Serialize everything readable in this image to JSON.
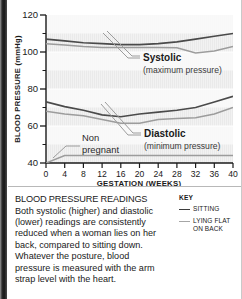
{
  "chart_data": {
    "type": "line",
    "title": "",
    "xlabel": "GESTATION (WEEKS)",
    "ylabel": "BLOOD PRESSURE (mmHg)",
    "xlim": [
      0,
      40
    ],
    "ylim": [
      40,
      120
    ],
    "xticks": [
      0,
      4,
      8,
      12,
      16,
      20,
      24,
      28,
      32,
      36,
      40
    ],
    "yticks": [
      40,
      60,
      80,
      100,
      120
    ],
    "yminorticks": [
      50,
      70,
      90,
      110
    ],
    "grid": "horizontal-bands",
    "legend_position": "below-right",
    "x": [
      0,
      4,
      8,
      12,
      16,
      20,
      24,
      28,
      32,
      36,
      40
    ],
    "series": [
      {
        "name": "Systolic - sitting",
        "group": "Systolic",
        "posture": "SITTING",
        "color": "#4a4a4a",
        "values": [
          107,
          106,
          105,
          104.5,
          104,
          104,
          104.5,
          105.5,
          107,
          108.5,
          110
        ]
      },
      {
        "name": "Systolic - lying flat on back",
        "group": "Systolic",
        "posture": "LYING FLAT ON BACK",
        "color": "#9c9c9c",
        "values": [
          104.5,
          103.8,
          103,
          102.5,
          102.5,
          102.5,
          102.5,
          102.3,
          99.5,
          100.5,
          103
        ]
      },
      {
        "name": "Diastolic - sitting",
        "group": "Diastolic",
        "posture": "SITTING",
        "color": "#4a4a4a",
        "values": [
          73,
          70.5,
          68.5,
          66,
          65,
          66.5,
          67.5,
          68.5,
          70,
          73,
          76
        ]
      },
      {
        "name": "Diastolic - lying flat on back",
        "group": "Diastolic",
        "posture": "LYING FLAT ON BACK",
        "color": "#9c9c9c",
        "values": [
          68,
          66.5,
          65.5,
          63.5,
          61.5,
          61.5,
          63.5,
          64,
          64.5,
          66.5,
          70
        ]
      },
      {
        "name": "Non pregnant baseline",
        "group": "Non pregnant",
        "posture": "",
        "color": "#9c9c9c",
        "values": [
          40,
          44,
          44,
          44,
          44,
          44,
          44,
          44,
          44,
          44,
          44
        ]
      }
    ],
    "annotations": [
      {
        "id": "systolic",
        "label": "Systolic",
        "sublabel": "(maximum pressure)"
      },
      {
        "id": "diastolic",
        "label": "Diastolic",
        "sublabel": "(minimum pressure)"
      },
      {
        "id": "non-pregnant",
        "label_line1": "Non",
        "label_line2": "pregnant"
      }
    ]
  },
  "caption": {
    "title": "BLOOD PRESSURE READINGS",
    "body": "Both systolic (higher) and diastolic (lower) readings are consistently reduced when a woman lies on her back, compared to sitting down. Whatever the posture, blood pressure is measured with the arm strap level with the heart."
  },
  "key": {
    "title": "KEY",
    "items": [
      {
        "label": "SITTING",
        "color": "#3d3d3d"
      },
      {
        "label": "LYING FLAT ON BACK",
        "color": "#a6a6a6"
      }
    ]
  }
}
